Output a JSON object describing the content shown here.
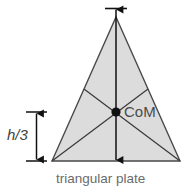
{
  "figure": {
    "caption": "triangular plate",
    "com_label": "CoM",
    "height_label": "h/3",
    "colors": {
      "plate_fill": "#dcdcdc",
      "outline": "#444444",
      "median": "#3a3a3a",
      "arrow": "#111111",
      "text": "#5e5e5e",
      "background": "#ffffff"
    },
    "geometry": {
      "apex": [
        116,
        17
      ],
      "base_left": [
        52,
        161
      ],
      "base_right": [
        180,
        161
      ],
      "centroid": [
        116,
        112
      ],
      "left_side_midpoint": [
        84,
        89
      ],
      "right_side_midpoint": [
        148,
        89
      ]
    },
    "annotations": {
      "vertical_axis": "median from apex to base midpoint",
      "dimension": "h/3 from base to center of mass",
      "dimension_top_y": 112,
      "dimension_bottom_y": 161,
      "dimension_x": 36
    }
  }
}
